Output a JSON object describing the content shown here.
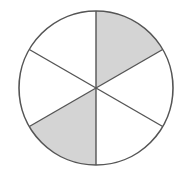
{
  "figure": {
    "kind": "fraction-circle-diagram",
    "background_color": "#ffffff"
  },
  "chart_data": {
    "type": "pie",
    "title": "",
    "subtitle": "",
    "xlabel": "",
    "ylabel": "",
    "grid": false,
    "legend": "none",
    "total_slices": 6,
    "shaded_slices": 2,
    "unshaded_slices": 4,
    "fraction_shaded": "2/6",
    "fraction_shaded_simplified": "1/3",
    "fraction_shaded_decimal": 0.3333,
    "slice_angle_degrees": 60,
    "categories": [
      "sector-1",
      "sector-2",
      "sector-3",
      "sector-4",
      "sector-5",
      "sector-6"
    ],
    "values": [
      60,
      60,
      60,
      60,
      60,
      60
    ],
    "series": [
      {
        "name": "sectors",
        "values": [
          60,
          60,
          60,
          60,
          60,
          60
        ]
      }
    ],
    "slices": [
      {
        "id": "sector-1",
        "label": "top-right",
        "start_angle": 30,
        "end_angle": 90,
        "shaded": true,
        "fill": "#d4d4d4"
      },
      {
        "id": "sector-2",
        "label": "top-left",
        "start_angle": 90,
        "end_angle": 150,
        "shaded": false,
        "fill": "#ffffff"
      },
      {
        "id": "sector-3",
        "label": "left",
        "start_angle": 150,
        "end_angle": 210,
        "shaded": false,
        "fill": "#ffffff"
      },
      {
        "id": "sector-4",
        "label": "bottom-left",
        "start_angle": 210,
        "end_angle": 270,
        "shaded": true,
        "fill": "#d4d4d4"
      },
      {
        "id": "sector-5",
        "label": "bottom-right",
        "start_angle": 270,
        "end_angle": 330,
        "shaded": false,
        "fill": "#ffffff"
      },
      {
        "id": "sector-6",
        "label": "right",
        "start_angle": 330,
        "end_angle": 390,
        "shaded": false,
        "fill": "#ffffff"
      }
    ]
  },
  "geometry": {
    "center_x": 96,
    "center_y": 88,
    "radius": 77
  },
  "colors": {
    "shaded_fill": "#d4d4d4",
    "unshaded_fill": "#ffffff",
    "stroke": "#555555",
    "background": "#ffffff"
  },
  "stroke": {
    "circle_width": 1.6,
    "divider_width": 1.4
  }
}
